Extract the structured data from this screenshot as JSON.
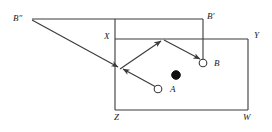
{
  "figure": {
    "kind": "geometric-reflection-diagram",
    "background_color": "#ffffff",
    "stroke_color": "#3a3a3a",
    "label_color": "#1a1a1a"
  },
  "labels": {
    "b_double_prime": "B″",
    "b_prime": "B′",
    "x": "X",
    "y": "Y",
    "z": "Z",
    "w": "W",
    "a": "A",
    "b": "B"
  },
  "label_positions": {
    "b_double_prime": {
      "x": 13,
      "y": 14
    },
    "b_prime": {
      "x": 207,
      "y": 12
    },
    "x": {
      "x": 104,
      "y": 32
    },
    "y": {
      "x": 254,
      "y": 31
    },
    "z": {
      "x": 114,
      "y": 113
    },
    "w": {
      "x": 243,
      "y": 113
    },
    "a": {
      "x": 170,
      "y": 85
    },
    "b": {
      "x": 214,
      "y": 59
    }
  },
  "table": {
    "name": "main-rectangle-XYWZ",
    "corners": {
      "X": {
        "x": 115,
        "y": 39
      },
      "Y": {
        "x": 248,
        "y": 39
      },
      "W": {
        "x": 248,
        "y": 110
      },
      "Z": {
        "x": 115,
        "y": 110
      }
    }
  },
  "construction_lines": [
    {
      "name": "top-reflection-line",
      "x1": 32,
      "y1": 19,
      "x2": 203,
      "y2": 19
    },
    {
      "name": "left-vertical-extension",
      "x1": 115,
      "y1": 19,
      "x2": 115,
      "y2": 39
    },
    {
      "name": "b-prime-vertical-drop",
      "x1": 203,
      "y1": 19,
      "x2": 203,
      "y2": 62
    }
  ],
  "arrows": [
    {
      "name": "arrow-b-double-prime-to-cushion",
      "x1": 32,
      "y1": 20,
      "x2": 120,
      "y2": 68
    },
    {
      "name": "arrow-a-to-cushion",
      "x1": 157,
      "y1": 88,
      "x2": 120,
      "y2": 68
    },
    {
      "name": "arrow-cushion-to-top-vertex",
      "x1": 120,
      "y1": 68,
      "x2": 163,
      "y2": 39
    },
    {
      "name": "arrow-top-vertex-to-b",
      "x1": 163,
      "y1": 39,
      "x2": 202,
      "y2": 61
    }
  ],
  "balls": [
    {
      "name": "ball-a",
      "label_key": "a",
      "fill": "#ffffff",
      "stroke": "#3a3a3a",
      "cx": 158,
      "cy": 89,
      "r": 4
    },
    {
      "name": "ball-b",
      "label_key": "b",
      "fill": "#ffffff",
      "stroke": "#3a3a3a",
      "cx": 203,
      "cy": 63,
      "r": 4
    },
    {
      "name": "ball-cue-black",
      "label_key": null,
      "fill": "#111111",
      "stroke": "#111111",
      "cx": 176,
      "cy": 75,
      "r": 4.5
    }
  ]
}
